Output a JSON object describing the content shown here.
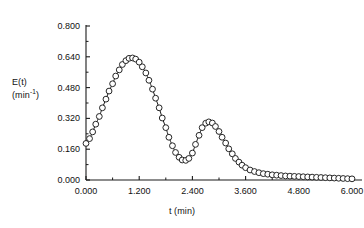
{
  "chart_data": {
    "type": "line",
    "title": "",
    "subtitle": "",
    "xlabel": "t (min)",
    "ylabel_line1": "E(t)",
    "ylabel_line2_prefix": "(min",
    "ylabel_line2_exponent": "-1",
    "ylabel_line2_suffix": ")",
    "xlim": [
      0.0,
      6.0
    ],
    "ylim": [
      0.0,
      0.8
    ],
    "grid": false,
    "legend": "none",
    "marker": "open-circle",
    "xticks": [
      0.0,
      1.2,
      2.4,
      3.6,
      4.8,
      6.0
    ],
    "xtick_labels": [
      "0.000",
      "1.200",
      "2.400",
      "3.600",
      "4.800",
      "6.000"
    ],
    "x_minor_ticks": [
      0.6,
      1.8,
      3.0,
      4.2,
      5.4
    ],
    "yticks": [
      0.0,
      0.16,
      0.32,
      0.48,
      0.64,
      0.8
    ],
    "ytick_labels": [
      "0.000",
      "0.160",
      "0.320",
      "0.480",
      "0.640",
      "0.800"
    ],
    "y_minor_ticks": [
      0.08,
      0.24,
      0.4,
      0.56,
      0.72
    ],
    "series": [
      {
        "name": "E(t)",
        "x": [
          0.0,
          0.08,
          0.15,
          0.22,
          0.3,
          0.37,
          0.45,
          0.52,
          0.6,
          0.67,
          0.75,
          0.82,
          0.9,
          0.97,
          1.05,
          1.12,
          1.2,
          1.27,
          1.35,
          1.42,
          1.5,
          1.57,
          1.65,
          1.72,
          1.8,
          1.87,
          1.95,
          2.02,
          2.1,
          2.17,
          2.25,
          2.32,
          2.4,
          2.47,
          2.55,
          2.62,
          2.7,
          2.77,
          2.85,
          2.92,
          3.0,
          3.07,
          3.15,
          3.22,
          3.3,
          3.37,
          3.45,
          3.52,
          3.6,
          3.7,
          3.8,
          3.9,
          4.0,
          4.1,
          4.2,
          4.3,
          4.4,
          4.5,
          4.6,
          4.7,
          4.8,
          4.9,
          5.0,
          5.1,
          5.2,
          5.3,
          5.4,
          5.5,
          5.6,
          5.7,
          5.8,
          5.9,
          6.0
        ],
        "y": [
          0.19,
          0.215,
          0.25,
          0.29,
          0.33,
          0.375,
          0.42,
          0.462,
          0.5,
          0.54,
          0.572,
          0.6,
          0.62,
          0.632,
          0.634,
          0.628,
          0.612,
          0.588,
          0.556,
          0.518,
          0.472,
          0.425,
          0.375,
          0.322,
          0.272,
          0.222,
          0.178,
          0.143,
          0.118,
          0.104,
          0.102,
          0.112,
          0.14,
          0.185,
          0.232,
          0.272,
          0.295,
          0.302,
          0.296,
          0.278,
          0.252,
          0.222,
          0.192,
          0.162,
          0.136,
          0.112,
          0.093,
          0.077,
          0.064,
          0.052,
          0.044,
          0.038,
          0.033,
          0.03,
          0.027,
          0.025,
          0.023,
          0.021,
          0.02,
          0.019,
          0.018,
          0.017,
          0.016,
          0.015,
          0.014,
          0.013,
          0.012,
          0.011,
          0.01,
          0.009,
          0.008,
          0.007,
          0.006
        ]
      }
    ],
    "colors": {
      "line": "#1a1a1a",
      "marker_fill": "#ffffff",
      "marker_stroke": "#1a1a1a",
      "axis": "#1a1a1a",
      "background": "#ffffff"
    },
    "geometry": {
      "plot_left": 86,
      "plot_right": 352,
      "plot_top": 26,
      "plot_bottom": 180,
      "marker_radius": 2.9,
      "tick_len_major": 4,
      "tick_len_minor": 2.5
    }
  }
}
